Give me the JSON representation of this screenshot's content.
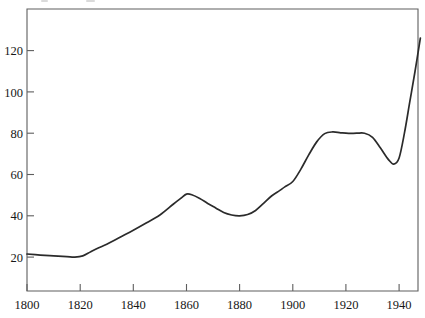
{
  "chart_data": {
    "type": "line",
    "title": "",
    "subtitle": "",
    "xlabel": "",
    "ylabel": "",
    "xlim": [
      1800,
      1948
    ],
    "ylim": [
      0,
      135
    ],
    "grid": false,
    "legend": null,
    "x_ticks": [
      1800,
      1820,
      1840,
      1860,
      1880,
      1900,
      1920,
      1940
    ],
    "y_ticks": [
      20,
      40,
      60,
      80,
      100,
      120
    ],
    "x_tick_labels": [
      "1800",
      "1820",
      "1840",
      "1860",
      "1880",
      "1900",
      "1920",
      "1940"
    ],
    "y_tick_labels": [
      "20",
      "40",
      "60",
      "80",
      "100",
      "120"
    ],
    "series": [
      {
        "name": "series-1",
        "color": "#2b2b2b",
        "x": [
          1800,
          1805,
          1810,
          1815,
          1818,
          1821,
          1824,
          1827,
          1830,
          1835,
          1840,
          1845,
          1850,
          1855,
          1858,
          1860,
          1862,
          1865,
          1868,
          1871,
          1874,
          1877,
          1880,
          1883,
          1886,
          1889,
          1892,
          1895,
          1897,
          1900,
          1903,
          1906,
          1909,
          1912,
          1915,
          1918,
          1921,
          1924,
          1927,
          1930,
          1933,
          1936,
          1938,
          1940,
          1942,
          1944,
          1946,
          1948
        ],
        "y": [
          21.5,
          21.0,
          20.6,
          20.2,
          20.0,
          20.6,
          22.6,
          24.5,
          26.2,
          29.6,
          33.0,
          36.6,
          40.4,
          45.6,
          48.6,
          50.5,
          50.2,
          48.4,
          46.0,
          43.8,
          41.6,
          40.4,
          40.0,
          40.6,
          42.6,
          46.0,
          49.6,
          52.2,
          54.0,
          56.6,
          62.5,
          69.5,
          75.8,
          79.8,
          80.6,
          80.2,
          79.9,
          80.0,
          80.0,
          78.0,
          72.8,
          67.2,
          65.0,
          68.0,
          80.0,
          95.0,
          110.0,
          126.0
        ]
      }
    ],
    "annotations": {
      "peak_1860": 50.5,
      "trough_1880": 40.0,
      "plateau_1912_1927": 80.0,
      "dip_1938": 65.0,
      "end_1948": 126.0,
      "start_1800": 21.5,
      "min_1818": 20.0
    }
  },
  "frame": {
    "axis_color": "#5e5e5e",
    "curve_color": "#2b2b2b",
    "background": "#ffffff"
  }
}
